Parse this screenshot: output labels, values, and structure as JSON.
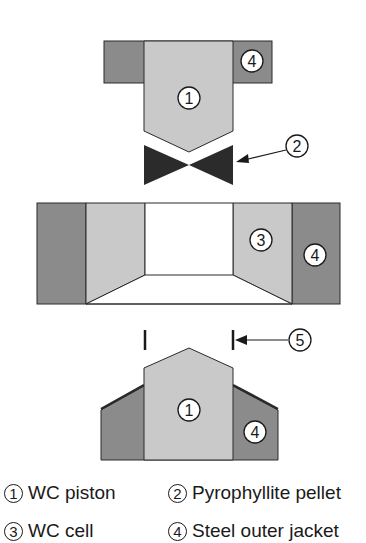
{
  "colors": {
    "wc": "#c9c9c9",
    "steel": "#8b8b8b",
    "pellet": "#2b2b2b",
    "outline": "#2a2a2a",
    "background": "#ffffff"
  },
  "callouts": {
    "top_piston": "1",
    "top_jacket": "4",
    "pellet": "2",
    "cell_wc": "3",
    "cell_jacket": "4",
    "marker": "5",
    "bottom_piston": "1",
    "bottom_jacket": "4"
  },
  "legend": {
    "items": [
      {
        "number": "1",
        "label": "WC piston"
      },
      {
        "number": "2",
        "label": "Pyrophyllite pellet"
      },
      {
        "number": "3",
        "label": "WC cell"
      },
      {
        "number": "4",
        "label": "Steel outer jacket"
      }
    ]
  }
}
